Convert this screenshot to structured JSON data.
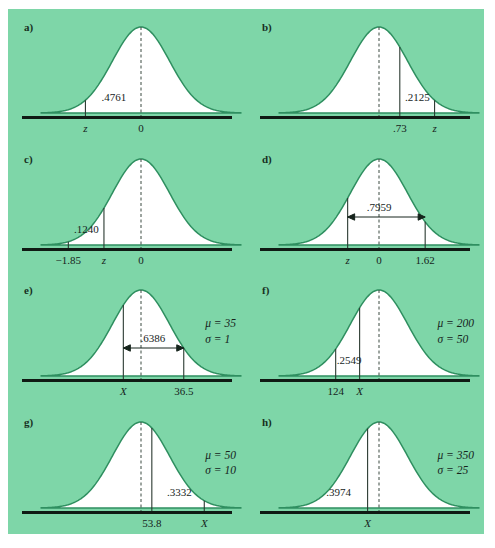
{
  "figure": {
    "background_color": "#7ed6a8",
    "curve_color": "#2f8f60",
    "axis_color": "#101a14",
    "panel_count": 8
  },
  "chart_data": {
    "type": "line",
    "title": "",
    "panels": [
      {
        "id": "a",
        "label": "a)",
        "curve": "normal",
        "mean_line": {
          "label": "0",
          "style": "dashed",
          "x_norm": 0.0
        },
        "lines": [
          {
            "label": "z",
            "style": "solid",
            "x_norm": -1.95,
            "italic": true
          }
        ],
        "area_label": ".4761",
        "area_label_x_norm": -0.95,
        "arrow": false,
        "params": null,
        "tick_labels": [
          "z",
          "0"
        ]
      },
      {
        "id": "b",
        "label": "b)",
        "curve": "normal",
        "mean_line": {
          "label": "",
          "style": "dashed",
          "x_norm": 0.0
        },
        "lines": [
          {
            "label": ".73",
            "style": "solid",
            "x_norm": 0.73,
            "italic": false
          },
          {
            "label": "z",
            "style": "solid",
            "x_norm": 1.95,
            "italic": true
          }
        ],
        "area_label": ".2125",
        "area_label_x_norm": 1.35,
        "arrow": false,
        "params": null,
        "tick_labels": [
          ".73",
          "z"
        ]
      },
      {
        "id": "c",
        "label": "c)",
        "curve": "normal",
        "mean_line": {
          "label": "0",
          "style": "dashed",
          "x_norm": 0.0
        },
        "lines": [
          {
            "label": "−1.85",
            "style": "solid",
            "x_norm": -2.55,
            "italic": false
          },
          {
            "label": "z",
            "style": "solid",
            "x_norm": -1.3,
            "italic": true
          }
        ],
        "area_label": ".1240",
        "area_label_x_norm": -1.92,
        "arrow": false,
        "params": null,
        "tick_labels": [
          "−1.85",
          "z",
          "0"
        ]
      },
      {
        "id": "d",
        "label": "d)",
        "curve": "normal",
        "mean_line": {
          "label": "0",
          "style": "dashed",
          "x_norm": 0.0
        },
        "lines": [
          {
            "label": "z",
            "style": "solid",
            "x_norm": -1.1,
            "italic": true
          },
          {
            "label": "1.62",
            "style": "solid",
            "x_norm": 1.62,
            "italic": false
          }
        ],
        "area_label": ".7959",
        "area_label_x_norm": 0.0,
        "arrow": true,
        "arrow_from_norm": -1.1,
        "arrow_to_norm": 1.62,
        "params": null,
        "tick_labels": [
          "z",
          "0",
          "1.62"
        ]
      },
      {
        "id": "e",
        "label": "e)",
        "curve": "normal",
        "mean_line": {
          "label": "",
          "style": "dashed",
          "x_norm": 0.0
        },
        "lines": [
          {
            "label": "X",
            "style": "solid",
            "x_norm": -0.62,
            "italic": true
          },
          {
            "label": "36.5",
            "style": "solid",
            "x_norm": 1.5,
            "italic": false
          }
        ],
        "area_label": ".6386",
        "area_label_x_norm": 0.42,
        "arrow": true,
        "arrow_from_norm": -0.62,
        "arrow_to_norm": 1.5,
        "params": {
          "mu": "μ = 35",
          "sigma": "σ = 1"
        },
        "tick_labels": [
          "X",
          "36.5"
        ]
      },
      {
        "id": "f",
        "label": "f)",
        "curve": "normal",
        "mean_line": {
          "label": "",
          "style": "dashed",
          "x_norm": 0.0
        },
        "lines": [
          {
            "label": "124",
            "style": "solid",
            "x_norm": -1.52,
            "italic": false
          },
          {
            "label": "X",
            "style": "solid",
            "x_norm": -0.68,
            "italic": true
          }
        ],
        "area_label": ".2549",
        "area_label_x_norm": -1.05,
        "arrow": false,
        "params": {
          "mu": "μ = 200",
          "sigma": "σ = 50"
        },
        "tick_labels": [
          "124",
          "X"
        ]
      },
      {
        "id": "g",
        "label": "g)",
        "curve": "normal",
        "mean_line": {
          "label": "",
          "style": "dashed",
          "x_norm": 0.0
        },
        "lines": [
          {
            "label": "53.8",
            "style": "solid",
            "x_norm": 0.38,
            "italic": false
          },
          {
            "label": "X",
            "style": "solid",
            "x_norm": 2.22,
            "italic": true
          }
        ],
        "area_label": ".3332",
        "area_label_x_norm": 1.35,
        "arrow": false,
        "params": {
          "mu": "μ = 50",
          "sigma": "σ = 10"
        },
        "tick_labels": [
          "53.8",
          "X"
        ]
      },
      {
        "id": "h",
        "label": "h)",
        "curve": "normal",
        "mean_line": {
          "label": "",
          "style": "dashed",
          "x_norm": 0.0
        },
        "lines": [
          {
            "label": "X",
            "style": "solid",
            "x_norm": -0.4,
            "italic": true
          }
        ],
        "area_label": ".3974",
        "area_label_x_norm": -1.42,
        "arrow": false,
        "params": {
          "mu": "μ = 350",
          "sigma": "σ = 25"
        },
        "tick_labels": [
          "X"
        ]
      }
    ]
  }
}
